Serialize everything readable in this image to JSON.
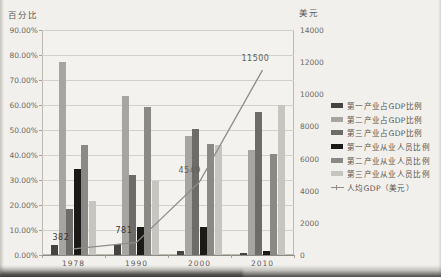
{
  "chart_data": {
    "type": "bar+line",
    "categories": [
      "1978",
      "1990",
      "2000",
      "2010"
    ],
    "series": [
      {
        "name": "第一产业占GDP比例",
        "color": "#454442",
        "values": [
          4.0,
          4.3,
          1.8,
          0.8
        ]
      },
      {
        "name": "第二产业占GDP比例",
        "color": "#a7a5a1",
        "values": [
          77.4,
          63.8,
          47.5,
          42.1
        ]
      },
      {
        "name": "第三产业占GDP比例",
        "color": "#6e6c69",
        "values": [
          18.6,
          31.9,
          50.6,
          57.3
        ]
      },
      {
        "name": "第一产业从业人员比例",
        "color": "#1b1a18",
        "values": [
          34.4,
          11.1,
          11.2,
          1.8
        ]
      },
      {
        "name": "第二产业从业人员比例",
        "color": "#8b8985",
        "values": [
          44.0,
          59.3,
          44.3,
          40.3
        ]
      },
      {
        "name": "第三产业从业人员比例",
        "color": "#c7c5c0",
        "values": [
          21.6,
          29.6,
          44.0,
          60.0
        ]
      }
    ],
    "line_series": {
      "name": "人均GDP（美元）",
      "color": "#8f8d89",
      "values": [
        382,
        781,
        4549,
        11500
      ],
      "labels": [
        "382",
        "781",
        "4549",
        "11500"
      ]
    },
    "left_axis": {
      "label": "百分比",
      "min": 0,
      "max": 90,
      "step": 10,
      "ticks": [
        "90.00%",
        "80.00%",
        "70.00%",
        "60.00%",
        "50.00%",
        "40.00%",
        "30.00%",
        "20.00%",
        "10.00%",
        "0.00%"
      ]
    },
    "right_axis": {
      "label": "美元",
      "min": 0,
      "max": 14000,
      "step": 2000,
      "ticks": [
        "14000",
        "12000",
        "10000",
        "8000",
        "6000",
        "4000",
        "2000",
        "0"
      ]
    },
    "grid": true,
    "legend_position": "right"
  }
}
